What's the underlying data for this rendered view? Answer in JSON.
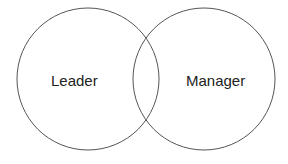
{
  "diagram": {
    "type": "venn",
    "circles": [
      {
        "label": "Leader",
        "cx": 88,
        "cy": 79,
        "r": 71
      },
      {
        "label": "Manager",
        "cx": 204,
        "cy": 79,
        "r": 71
      }
    ],
    "stroke_color": "#555555",
    "background": "#ffffff"
  }
}
